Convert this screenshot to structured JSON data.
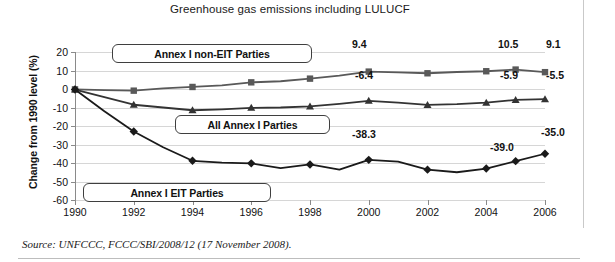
{
  "chart_data": {
    "type": "line",
    "title": "Greenhouse gas emissions including LULUCF",
    "xlabel": "",
    "ylabel": "Change from 1990 level (%)",
    "x": [
      1990,
      1991,
      1992,
      1993,
      1994,
      1995,
      1996,
      1997,
      1998,
      1999,
      2000,
      2001,
      2002,
      2003,
      2004,
      2005,
      2006
    ],
    "xticks": [
      1990,
      1992,
      1994,
      1996,
      1998,
      2000,
      2002,
      2004,
      2006
    ],
    "xlim": [
      1990,
      2006
    ],
    "yticks": [
      20,
      10,
      0,
      -10,
      -20,
      -30,
      -40,
      -50,
      -60
    ],
    "ylim": [
      -60,
      20
    ],
    "grid": true,
    "legend_position": "inside-boxes",
    "series": [
      {
        "name": "Annex I non-EIT Parties",
        "marker": "square",
        "color": "#595959",
        "values": [
          -0.2,
          -0.6,
          -0.9,
          0.3,
          1.1,
          2.0,
          3.6,
          4.2,
          5.6,
          7.2,
          9.4,
          9.0,
          8.5,
          9.2,
          9.6,
          10.5,
          9.1
        ]
      },
      {
        "name": "All Annex I Parties",
        "marker": "triangle",
        "color": "#333333",
        "values": [
          -0.3,
          -4.4,
          -8.5,
          -10.0,
          -11.5,
          -11.0,
          -10.2,
          -10.0,
          -9.4,
          -8.0,
          -6.4,
          -7.4,
          -8.6,
          -8.2,
          -7.4,
          -5.9,
          -5.5
        ]
      },
      {
        "name": "Annex I EIT Parties",
        "marker": "diamond",
        "color": "#1a1a1a",
        "values": [
          -0.3,
          -12.0,
          -23.0,
          -31.5,
          -38.8,
          -39.8,
          -40.2,
          -42.8,
          -40.8,
          -43.6,
          -38.3,
          -39.3,
          -43.6,
          -45.0,
          -43.0,
          -39.0,
          -35.0
        ]
      }
    ],
    "data_labels": [
      {
        "series": "Annex I non-EIT Parties",
        "x": 2000,
        "value": "9.4"
      },
      {
        "series": "Annex I non-EIT Parties",
        "x": 2005,
        "value": "10.5"
      },
      {
        "series": "Annex I non-EIT Parties",
        "x": 2006,
        "value": "9.1"
      },
      {
        "series": "All Annex I Parties",
        "x": 2000,
        "value": "-6.4"
      },
      {
        "series": "All Annex I Parties",
        "x": 2005,
        "value": "-5.9"
      },
      {
        "series": "All Annex I Parties",
        "x": 2006,
        "value": "-5.5"
      },
      {
        "series": "Annex I EIT Parties",
        "x": 2000,
        "value": "-38.3"
      },
      {
        "series": "Annex I EIT Parties",
        "x": 2005,
        "value": "-39.0"
      },
      {
        "series": "Annex I EIT Parties",
        "x": 2006,
        "value": "-35.0"
      }
    ]
  },
  "legend": {
    "non_eit": "Annex I non-EIT Parties",
    "all_annex": "All Annex I Parties",
    "eit": "Annex I EIT Parties"
  },
  "yticks": {
    "t0": "20",
    "t1": "10",
    "t2": "0",
    "t3": "-10",
    "t4": "-20",
    "t5": "-30",
    "t6": "-40",
    "t7": "-50",
    "t8": "-60"
  },
  "xticks": {
    "t0": "1990",
    "t1": "1992",
    "t2": "1994",
    "t3": "1996",
    "t4": "1998",
    "t5": "2000",
    "t6": "2002",
    "t7": "2004",
    "t8": "2006"
  },
  "labels": {
    "l_94": "9.4",
    "l_105": "10.5",
    "l_91": "9.1",
    "l_m64": "-6.4",
    "l_m59": "-5.9",
    "l_m55": "-5.5",
    "l_m383": "-38.3",
    "l_m390": "-39.0",
    "l_m350": "-35.0"
  },
  "footer": {
    "source": "Source: UNFCCC, FCCC/SBI/2008/12 (17 November 2008)."
  }
}
